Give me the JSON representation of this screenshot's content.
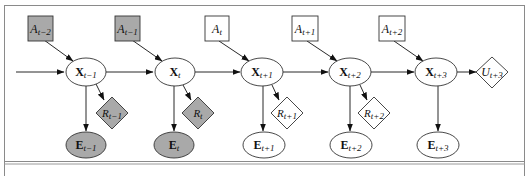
{
  "diagram": {
    "type": "dynamic decision network",
    "colors": {
      "observed_fill": "#a9a9a9",
      "unobserved_fill": "#ffffff",
      "stroke": "#333333",
      "frame": "#8a8a8a"
    },
    "action_nodes": [
      {
        "id": "A_t-2",
        "base": "A",
        "sub": "t−2",
        "observed": true
      },
      {
        "id": "A_t-1",
        "base": "A",
        "sub": "t−1",
        "observed": true
      },
      {
        "id": "A_t",
        "base": "A",
        "sub": "t",
        "observed": false
      },
      {
        "id": "A_t+1",
        "base": "A",
        "sub": "t+1",
        "observed": false
      },
      {
        "id": "A_t+2",
        "base": "A",
        "sub": "t+2",
        "observed": false
      }
    ],
    "state_nodes": [
      {
        "id": "X_t-1",
        "base": "X",
        "sub": "t−1"
      },
      {
        "id": "X_t",
        "base": "X",
        "sub": "t"
      },
      {
        "id": "X_t+1",
        "base": "X",
        "sub": "t+1"
      },
      {
        "id": "X_t+2",
        "base": "X",
        "sub": "t+2"
      },
      {
        "id": "X_t+3",
        "base": "X",
        "sub": "t+3"
      }
    ],
    "reward_nodes": [
      {
        "id": "R_t-1",
        "base": "R",
        "sub": "t−1",
        "observed": true
      },
      {
        "id": "R_t",
        "base": "R",
        "sub": "t",
        "observed": true
      },
      {
        "id": "R_t+1",
        "base": "R",
        "sub": "t+1",
        "observed": false
      },
      {
        "id": "R_t+2",
        "base": "R",
        "sub": "t+2",
        "observed": false
      }
    ],
    "utility_node": {
      "id": "U_t+3",
      "base": "U",
      "sub": "t+3"
    },
    "evidence_nodes": [
      {
        "id": "E_t-1",
        "base": "E",
        "sub": "t−1",
        "observed": true
      },
      {
        "id": "E_t",
        "base": "E",
        "sub": "t",
        "observed": true
      },
      {
        "id": "E_t+1",
        "base": "E",
        "sub": "t+1",
        "observed": false
      },
      {
        "id": "E_t+2",
        "base": "E",
        "sub": "t+2",
        "observed": false
      },
      {
        "id": "E_t+3",
        "base": "E",
        "sub": "t+3",
        "observed": false
      }
    ]
  }
}
